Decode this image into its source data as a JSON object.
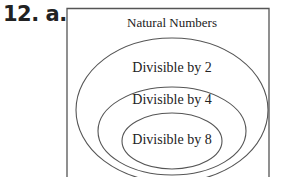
{
  "problem": {
    "label": "12. a."
  },
  "diagram": {
    "type": "nested-venn",
    "universe": "Natural Numbers",
    "sets": [
      {
        "name": "Divisible by 2"
      },
      {
        "name": "Divisible by 4"
      },
      {
        "name": "Divisible by 8"
      }
    ],
    "colors": {
      "stroke": "#555555",
      "text": "#222222",
      "background": "#ffffff"
    }
  }
}
